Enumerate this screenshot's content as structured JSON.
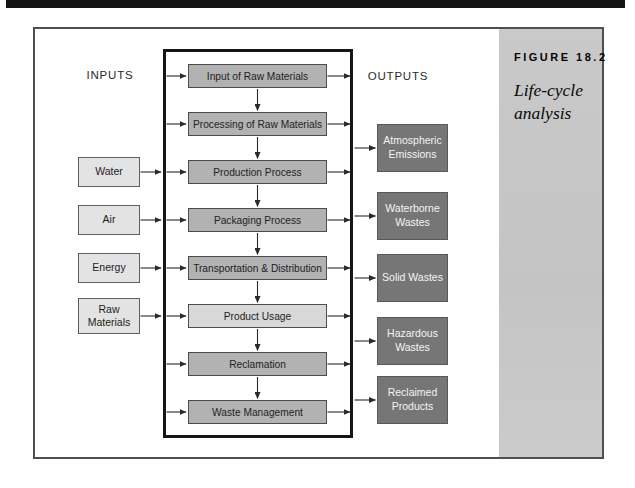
{
  "figure": {
    "number_label": "FIGURE 18.2",
    "caption": {
      "line1": "Life-cycle",
      "line2": "analysis"
    }
  },
  "diagram": {
    "inputs_header": "INPUTS",
    "outputs_header": "OUTPUTS",
    "process_steps": [
      "Input of Raw Materials",
      "Processing of Raw Materials",
      "Production Process",
      "Packaging Process",
      "Transportation & Distribution",
      "Product Usage",
      "Reclamation",
      "Waste Management"
    ],
    "inputs": [
      "Water",
      "Air",
      "Energy",
      "Raw Materials"
    ],
    "outputs": [
      "Atmospheric Emissions",
      "Waterborne Wastes",
      "Solid Wastes",
      "Hazardous Wastes",
      "Reclaimed Products"
    ]
  },
  "colors": {
    "process_box_fill": "#b2b2b2",
    "product_usage_fill": "#d8d8d8",
    "input_box_fill": "#e3e3e3",
    "output_box_fill": "#767676",
    "output_box_text": "#f4f4f4",
    "sidebar_background": "#c6c6c6",
    "frame_border": "#4f4f4f",
    "system_boundary_border": "#161616",
    "arrow_color": "#2a2a2a",
    "top_rule": "#141414"
  }
}
